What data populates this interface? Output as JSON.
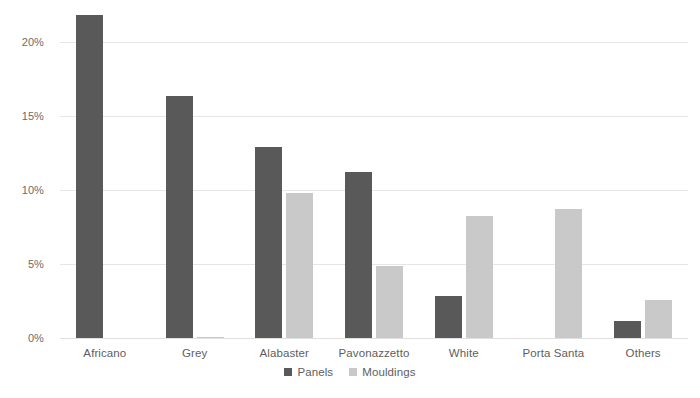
{
  "chart_data": {
    "type": "bar",
    "title": "",
    "subtitle": "",
    "xlabel": "",
    "ylabel": "",
    "categories": [
      "Africano",
      "Grey",
      "Alabaster",
      "Pavonazzetto",
      "White",
      "Porta Santa",
      "Others"
    ],
    "series": [
      {
        "name": "Panels",
        "color": "#595959",
        "values": [
          21.8,
          16.35,
          12.9,
          11.2,
          2.85,
          0,
          1.15
        ]
      },
      {
        "name": "Mouldings",
        "color": "#c9c9c9",
        "values": [
          0,
          0.1,
          9.8,
          4.9,
          8.25,
          8.7,
          2.6
        ]
      }
    ],
    "ylim": [
      0,
      22.3
    ],
    "yticks": [
      0,
      5,
      10,
      15,
      20
    ],
    "ytick_labels": [
      "0%",
      "5%",
      "10%",
      "15%",
      "20%"
    ],
    "grid": true,
    "grid_color": "#e6e6e6",
    "legend_position": "bottom-center",
    "background": "#ffffff"
  },
  "axis": {
    "y_tick_0": "0%",
    "y_tick_1": "5%",
    "y_tick_2": "10%",
    "y_tick_3": "15%",
    "y_tick_4": "20%"
  },
  "categories": {
    "c0": "Africano",
    "c1": "Grey",
    "c2": "Alabaster",
    "c3": "Pavonazzetto",
    "c4": "White",
    "c5": "Porta Santa",
    "c6": "Others"
  },
  "legend": {
    "panels_label": "Panels",
    "mouldings_label": "Mouldings"
  }
}
